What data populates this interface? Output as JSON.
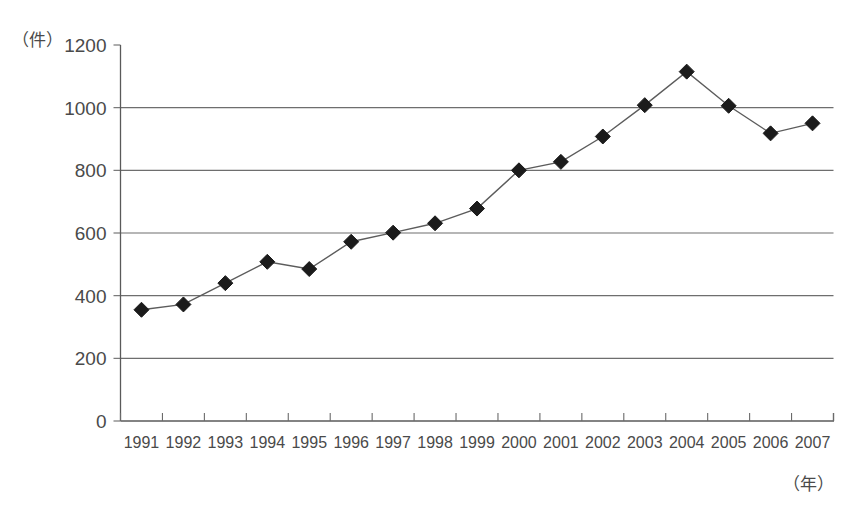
{
  "chart_data": {
    "type": "line",
    "title": "",
    "subtitle": "",
    "xlabel": "（年）",
    "ylabel": "（件）",
    "categories": [
      "1991",
      "1992",
      "1993",
      "1994",
      "1995",
      "1996",
      "1997",
      "1998",
      "1999",
      "2000",
      "2001",
      "2002",
      "2003",
      "2004",
      "2005",
      "2006",
      "2007"
    ],
    "values": [
      355,
      372,
      440,
      508,
      485,
      572,
      601,
      631,
      678,
      800,
      827,
      908,
      1008,
      1115,
      1006,
      918,
      950
    ],
    "series": [
      {
        "name": "件数",
        "values": [
          355,
          372,
          440,
          508,
          485,
          572,
          601,
          631,
          678,
          800,
          827,
          908,
          1008,
          1115,
          1006,
          918,
          950
        ]
      }
    ],
    "ylim": [
      0,
      1200
    ],
    "yticks": [
      0,
      200,
      400,
      600,
      800,
      1000,
      1200
    ],
    "ytick_labels": [
      "0",
      "200",
      "400",
      "600",
      "800",
      "1000",
      "1200"
    ],
    "xtick_labels": [
      "1991",
      "1992",
      "1993",
      "1994",
      "1995",
      "1996",
      "1997",
      "1998",
      "1999",
      "2000",
      "2001",
      "2002",
      "2003",
      "2004",
      "2005",
      "2006",
      "2007"
    ],
    "grid": true,
    "grid_axis": "y",
    "legend": false,
    "legend_position": "none",
    "marker": "diamond",
    "line_color": "#5c5c5c",
    "marker_color": "#1b1b1b",
    "background_color": "#ffffff",
    "axis_color": "#5a5a5a",
    "text_color": "#4a4a4a"
  },
  "labels": {
    "y_unit": "（件）",
    "x_unit": "（年）"
  }
}
